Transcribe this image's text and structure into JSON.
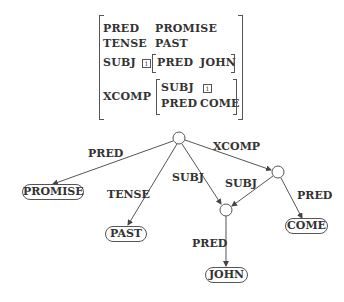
{
  "avm": {
    "rows": [
      {
        "attr": "PRED",
        "value": "PROMISE"
      },
      {
        "attr": "TENSE",
        "value": "PAST"
      },
      {
        "attr": "SUBJ",
        "tag": "1",
        "inner": [
          {
            "attr": "PRED",
            "value": "JOHN"
          }
        ]
      },
      {
        "attr": "XCOMP",
        "inner": [
          {
            "attr": "SUBJ",
            "tag": "1"
          },
          {
            "attr": "PRED",
            "value": "COME"
          }
        ]
      }
    ]
  },
  "graph": {
    "nodes": {
      "root": {
        "type": "circle"
      },
      "xcomp": {
        "type": "circle"
      },
      "subj": {
        "type": "circle"
      },
      "promise": {
        "label": "PROMISE"
      },
      "past": {
        "label": "PAST"
      },
      "come": {
        "label": "COME"
      },
      "john": {
        "label": "JOHN"
      }
    },
    "edges": [
      {
        "from": "root",
        "to": "promise",
        "label": "PRED"
      },
      {
        "from": "root",
        "to": "past",
        "label": "TENSE"
      },
      {
        "from": "root",
        "to": "subj",
        "label": "SUBJ"
      },
      {
        "from": "root",
        "to": "xcomp",
        "label": "XCOMP"
      },
      {
        "from": "xcomp",
        "to": "subj",
        "label": "SUBJ"
      },
      {
        "from": "xcomp",
        "to": "come",
        "label": "PRED"
      },
      {
        "from": "subj",
        "to": "john",
        "label": "PRED"
      }
    ]
  }
}
